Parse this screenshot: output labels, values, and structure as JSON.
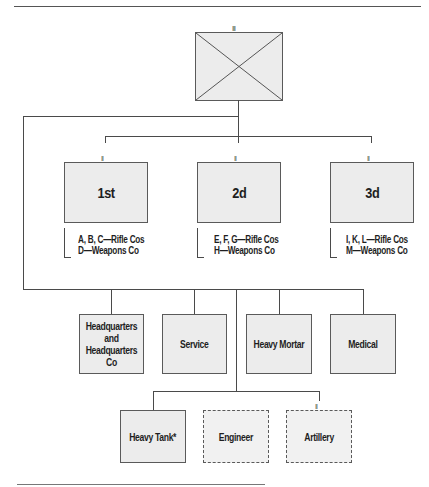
{
  "diagram": {
    "type": "organization-chart",
    "regiment": {
      "echelon": "III",
      "symbol": "infantry-crossed-box"
    },
    "battalions": [
      {
        "label": "1st",
        "echelon": "II",
        "companies": [
          "A, B, C—Rifle Cos",
          "D—Weapons Co"
        ]
      },
      {
        "label": "2d",
        "echelon": "II",
        "companies": [
          "E, F, G—Rifle Cos",
          "H—Weapons Co"
        ]
      },
      {
        "label": "3d",
        "echelon": "II",
        "companies": [
          "I, K, L—Rifle Cos",
          "M—Weapons Co"
        ]
      }
    ],
    "regimental_units": [
      {
        "label": "Headquarters\nand\nHeadquarters\nCo",
        "echelon": "I",
        "style": "solid"
      },
      {
        "label": "Service",
        "echelon": "I",
        "style": "solid"
      },
      {
        "label": "Heavy Mortar",
        "echelon": "I",
        "style": "solid"
      },
      {
        "label": "Medical",
        "echelon": "I",
        "style": "solid"
      }
    ],
    "attached_units": [
      {
        "label": "Heavy Tank*",
        "echelon": "I",
        "style": "solid"
      },
      {
        "label": "Engineer",
        "echelon": "I",
        "style": "dashed"
      },
      {
        "label": "Artillery",
        "echelon": "II",
        "style": "dashed"
      }
    ]
  }
}
